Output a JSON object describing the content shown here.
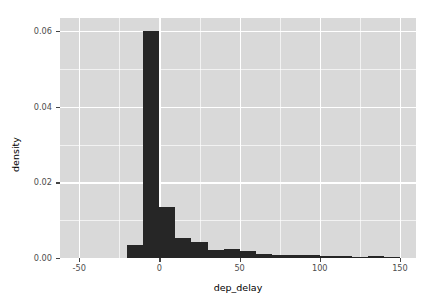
{
  "chart_data": {
    "type": "bar",
    "subtype": "histogram",
    "title": "",
    "xlabel": "dep_delay",
    "ylabel": "density",
    "xlim": [
      -62,
      160
    ],
    "ylim": [
      0,
      0.0635
    ],
    "grid": true,
    "legend": "none",
    "bin_width": 10,
    "bar_color": "#262626",
    "panel_background": "#d9d9d9",
    "gridline_color": "#ffffff",
    "x_ticks": [
      {
        "value": -50,
        "label": "-50"
      },
      {
        "value": 0,
        "label": "0"
      },
      {
        "value": 50,
        "label": "50"
      },
      {
        "value": 100,
        "label": "100"
      },
      {
        "value": 150,
        "label": "150"
      }
    ],
    "x_minor_ticks": [
      -25,
      25,
      75,
      125
    ],
    "y_ticks": [
      {
        "value": 0.0,
        "label": "0.00"
      },
      {
        "value": 0.02,
        "label": "0.02"
      },
      {
        "value": 0.04,
        "label": "0.04"
      },
      {
        "value": 0.06,
        "label": "0.06"
      }
    ],
    "y_minor_ticks": [
      0.01,
      0.03,
      0.05
    ],
    "bins": [
      {
        "x0": -20,
        "x1": -10,
        "density": 0.00345
      },
      {
        "x0": -10,
        "x1": 0,
        "density": 0.06
      },
      {
        "x0": 0,
        "x1": 10,
        "density": 0.01345
      },
      {
        "x0": 10,
        "x1": 20,
        "density": 0.0053
      },
      {
        "x0": 20,
        "x1": 30,
        "density": 0.00425
      },
      {
        "x0": 30,
        "x1": 40,
        "density": 0.002
      },
      {
        "x0": 40,
        "x1": 50,
        "density": 0.0024
      },
      {
        "x0": 50,
        "x1": 60,
        "density": 0.00185
      },
      {
        "x0": 60,
        "x1": 70,
        "density": 0.001
      },
      {
        "x0": 70,
        "x1": 80,
        "density": 0.00085
      },
      {
        "x0": 80,
        "x1": 90,
        "density": 0.0009
      },
      {
        "x0": 90,
        "x1": 100,
        "density": 0.0007
      },
      {
        "x0": 100,
        "x1": 110,
        "density": 0.0006
      },
      {
        "x0": 110,
        "x1": 120,
        "density": 0.00055
      },
      {
        "x0": 120,
        "x1": 130,
        "density": 0.0003
      },
      {
        "x0": 130,
        "x1": 140,
        "density": 0.00065
      },
      {
        "x0": 140,
        "x1": 150,
        "density": 0.0001
      }
    ]
  }
}
